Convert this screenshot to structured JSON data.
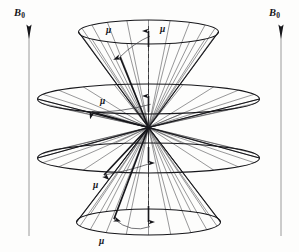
{
  "figure": {
    "type": "vector-cone-precession-diagram",
    "title_visible": false,
    "background_color": "#fdfdfc",
    "ink_color": "#16161a",
    "width": 299,
    "height": 252
  },
  "field_axes": [
    {
      "name": "left-field-axis",
      "label": "B",
      "subscript": "0",
      "label_x": 14,
      "label_y": 8,
      "arrow_tip_x": 29,
      "arrow_tip_y": 24,
      "line_bottom_y": 236,
      "direction": "up"
    },
    {
      "name": "right-field-axis",
      "label": "B",
      "subscript": "0",
      "label_x": 269,
      "label_y": 8,
      "arrow_tip_x": 281,
      "arrow_tip_y": 24,
      "line_bottom_y": 236,
      "direction": "up"
    }
  ],
  "apex": {
    "x": 148.5,
    "y": 127.5
  },
  "symmetry_axis": {
    "name": "dashed-symmetry-axis",
    "x": 148.5,
    "top_y": 26,
    "bottom_y": 228,
    "style": "dashed"
  },
  "cones": [
    {
      "id": "cone-1",
      "position": "top-narrow",
      "orientation": "up",
      "rim_center_x": 148.5,
      "rim_center_y": 32,
      "rim_rx": 70,
      "rim_ry": 12,
      "generator_count": 20,
      "mu_labels": [
        {
          "text": "μ",
          "x": 106,
          "y": 26
        },
        {
          "text": "μ",
          "x": 160,
          "y": 25
        }
      ],
      "mu_vector": {
        "from_apex": true,
        "tip_x": 120,
        "tip_y": 57
      },
      "precession_arc": true
    },
    {
      "id": "cone-2",
      "position": "upper-wide",
      "orientation": "up",
      "rim_center_x": 148.5,
      "rim_center_y": 99,
      "rim_rx": 111,
      "rim_ry": 15,
      "generator_count": 20,
      "mu_labels": [
        {
          "text": "μ",
          "x": 100,
          "y": 97
        }
      ],
      "mu_vector": {
        "from_apex": true,
        "tip_x": 92,
        "tip_y": 112
      },
      "precession_arc": true
    },
    {
      "id": "cone-3",
      "position": "lower-wide",
      "orientation": "down",
      "rim_center_x": 148.5,
      "rim_center_y": 158,
      "rim_rx": 111,
      "rim_ry": 15,
      "generator_count": 20,
      "mu_labels": [
        {
          "text": "μ",
          "x": 93,
          "y": 181
        }
      ],
      "mu_vector": {
        "from_apex": true,
        "tip_x": 104,
        "tip_y": 175
      },
      "precession_arc": true
    },
    {
      "id": "cone-4",
      "position": "bottom-narrow",
      "orientation": "down",
      "rim_center_x": 148.5,
      "rim_center_y": 222,
      "rim_rx": 72,
      "rim_ry": 13,
      "generator_count": 20,
      "mu_labels": [
        {
          "text": "μ",
          "x": 99,
          "y": 237
        }
      ],
      "mu_vector": {
        "from_apex": true,
        "tip_x": 114,
        "tip_y": 219
      },
      "precession_arc": true
    }
  ],
  "axis_mu_arrows": [
    {
      "name": "mu-arrow-cone-1",
      "x": 148.5,
      "tail_y": 47,
      "tip_y": 31
    },
    {
      "name": "mu-arrow-cone-2",
      "x": 148.5,
      "tail_y": 112,
      "tip_y": 96
    },
    {
      "name": "mu-arrow-cone-3",
      "x": 148.5,
      "tail_y": 147,
      "tip_y": 163
    },
    {
      "name": "mu-arrow-cone-4",
      "x": 148.5,
      "tail_y": 206,
      "tip_y": 222
    }
  ],
  "mu_symbol": "μ",
  "b_symbol": "B",
  "b_subscript": "0"
}
